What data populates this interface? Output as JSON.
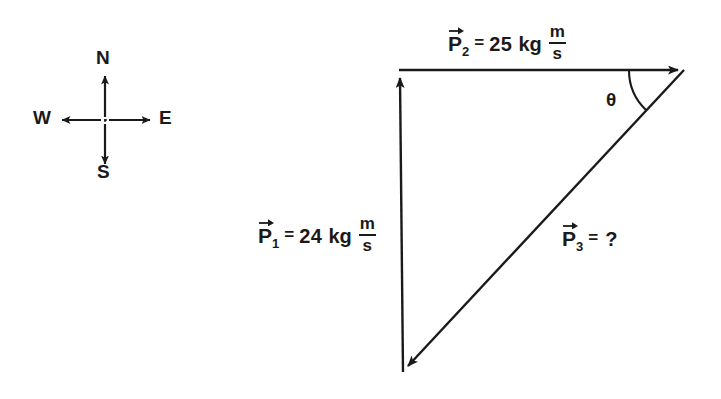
{
  "figure": {
    "stroke_color": "#1a1a1a",
    "background_color": "#ffffff"
  },
  "compass": {
    "name": "compass-rose",
    "north": "N",
    "south": "S",
    "west": "W",
    "east": "E",
    "center": {
      "x": 105,
      "y": 120
    }
  },
  "vectors": {
    "p1": {
      "symbol": "P",
      "subscript": "1",
      "equals": "=",
      "magnitude": "24",
      "unit_mass": "kg",
      "unit_numerator": "m",
      "unit_denominator": "s",
      "direction": "north",
      "start": {
        "x": 403,
        "y": 372
      },
      "end": {
        "x": 400,
        "y": 70
      }
    },
    "p2": {
      "symbol": "P",
      "subscript": "2",
      "equals": "=",
      "magnitude": "25",
      "unit_mass": "kg",
      "unit_numerator": "m",
      "unit_denominator": "s",
      "direction": "east",
      "start": {
        "x": 400,
        "y": 70
      },
      "end": {
        "x": 684,
        "y": 70
      }
    },
    "p3": {
      "symbol": "P",
      "subscript": "3",
      "equals": "=",
      "magnitude": "?",
      "direction": "southwest",
      "start": {
        "x": 684,
        "y": 70
      },
      "end": {
        "x": 403,
        "y": 372
      }
    }
  },
  "angle": {
    "name": "theta",
    "label": "θ",
    "vertex": {
      "x": 684,
      "y": 70
    }
  }
}
